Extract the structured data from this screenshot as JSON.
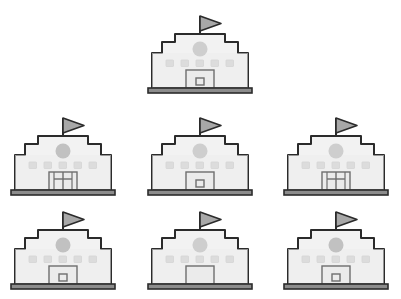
{
  "page": {
    "background_color": "#ffffff",
    "width": 401,
    "height": 299,
    "icon_name": "town-hall-building-icon",
    "repeat_count": 7,
    "layout": "1 icon centered in row 1, 3 icons in row 2, 3 icons in row 3"
  },
  "palette": {
    "outline": "#2b2b2b",
    "facade_fill": "#f2f2f2",
    "facade_fill_lower": "#ededed",
    "window_fill": "#dcdcdc",
    "window_stroke": "#d2d2d2",
    "clock_fill": "#b8b8b8",
    "clock_fill_light": "#c8c8c8",
    "flag_fill": "#a8a8a8",
    "flag_stroke": "#2b2b2b",
    "base_fill": "#8c8c8c",
    "base_stroke": "#2b2b2b",
    "door_fill": "#ebebeb",
    "door_stroke": "#6e6e6e"
  },
  "icon_parts": {
    "flag": "flag-triangle",
    "pole": "flag-pole",
    "roof_top": "upper-tier-roof",
    "roof_mid": "middle-tier-roof",
    "roof_low": "lower-tier-roof",
    "clock": "clock-circle",
    "windows": "window-square",
    "door": "entrance-door",
    "base": "foundation-plinth"
  },
  "buildings": [
    {
      "id": "building-1",
      "position": "row1-center",
      "row": 1,
      "column": 2,
      "door_style": "square-window",
      "clock_opacity": "light",
      "window_count": 5,
      "label": "Town hall building icon 1"
    },
    {
      "id": "building-2",
      "position": "row2-left",
      "row": 2,
      "column": 1,
      "door_style": "mullion-grid",
      "clock_opacity": "dark",
      "window_count": 5,
      "label": "Town hall building icon 2"
    },
    {
      "id": "building-3",
      "position": "row2-center",
      "row": 2,
      "column": 2,
      "door_style": "square-window",
      "clock_opacity": "light",
      "window_count": 5,
      "label": "Town hall building icon 3"
    },
    {
      "id": "building-4",
      "position": "row2-right",
      "row": 2,
      "column": 3,
      "door_style": "mullion-grid",
      "clock_opacity": "light",
      "window_count": 5,
      "label": "Town hall building icon 4"
    },
    {
      "id": "building-5",
      "position": "row3-left",
      "row": 3,
      "column": 1,
      "door_style": "square-window",
      "clock_opacity": "dark",
      "window_count": 5,
      "label": "Town hall building icon 5"
    },
    {
      "id": "building-6",
      "position": "row3-center",
      "row": 3,
      "column": 2,
      "door_style": "plain",
      "clock_opacity": "light",
      "window_count": 5,
      "label": "Town hall building icon 6"
    },
    {
      "id": "building-7",
      "position": "row3-right",
      "row": 3,
      "column": 3,
      "door_style": "square-window",
      "clock_opacity": "dark",
      "window_count": 5,
      "label": "Town hall building icon 7"
    }
  ]
}
